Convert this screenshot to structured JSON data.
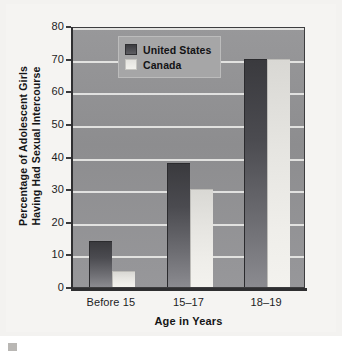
{
  "figure": {
    "background_color": "#f5f4f2",
    "plot_background_color": "#8f8f92",
    "gridline_color": "#e8e8e6"
  },
  "chart_data": {
    "type": "bar",
    "title": "",
    "subtitle": "",
    "xlabel": "Age in Years",
    "ylabel": "Percentage of Adolescent Girls Having Had Sexual Intercourse",
    "ylabel_line1": "Percentage of Adolescent Girls",
    "ylabel_line2": "Having Had Sexual Intercourse",
    "categories": [
      "Before 15",
      "15–17",
      "18–19"
    ],
    "series": [
      {
        "name": "United States",
        "color": "#4b4b50",
        "values": [
          14,
          38,
          70
        ]
      },
      {
        "name": "Canada",
        "color": "#eceae6",
        "values": [
          5,
          30,
          70
        ]
      }
    ],
    "ylim": [
      0,
      80
    ],
    "ytick_values": [
      0,
      10,
      20,
      30,
      40,
      50,
      60,
      70,
      80
    ],
    "ytick_labels": [
      "0",
      "10",
      "20",
      "30",
      "40",
      "50",
      "60",
      "70",
      "80"
    ],
    "grid": true,
    "grid_axis": "y",
    "legend_position": "upper left (inside axes)",
    "legend_entries": [
      "United States",
      "Canada"
    ]
  }
}
